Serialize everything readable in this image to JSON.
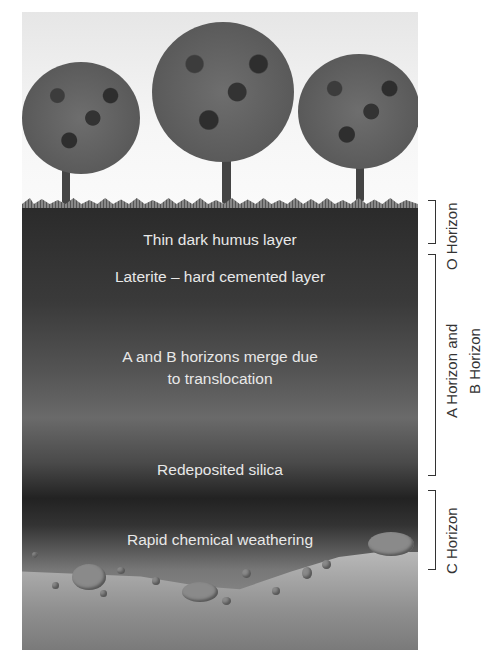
{
  "diagram": {
    "layer_labels": [
      {
        "id": "humus",
        "text": "Thin dark humus layer"
      },
      {
        "id": "laterite",
        "text": "Laterite – hard cemented layer"
      },
      {
        "id": "merge",
        "text": "A and B horizons merge due to translocation",
        "lines": [
          "A and B horizons merge due",
          "to translocation"
        ]
      },
      {
        "id": "silica",
        "text": "Redeposited silica"
      },
      {
        "id": "weathering",
        "text": "Rapid chemical weathering"
      }
    ],
    "horizons": [
      {
        "id": "o",
        "label": "O Horizon"
      },
      {
        "id": "ab",
        "label": "A Horizon and B Horizon",
        "lines": [
          "A Horizon and",
          "B Horizon"
        ]
      },
      {
        "id": "c",
        "label": "C Horizon"
      }
    ],
    "trees": 3
  }
}
